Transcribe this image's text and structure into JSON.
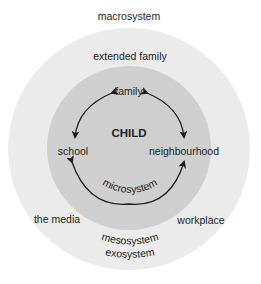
{
  "diagram": {
    "type": "nested-circles",
    "colors": {
      "background": "#ffffff",
      "outer_circle": "#ebebeb",
      "inner_circle": "#cfcfcf",
      "text": "#1e1e1e",
      "arrows": "#1e1e1e"
    },
    "labels": {
      "macrosystem": "macrosystem",
      "extended_family": "extended family",
      "family": "family",
      "child": "CHILD",
      "school": "school",
      "neighbourhood": "neighbourhood",
      "microsystem": "microsystem",
      "the_media": "the media",
      "mesosystem": "mesosystem",
      "workplace": "workplace",
      "exosystem": "exosystem"
    },
    "relationships": [
      {
        "from": "family",
        "to": "school",
        "type": "bidirectional"
      },
      {
        "from": "family",
        "to": "neighbourhood",
        "type": "bidirectional"
      },
      {
        "from": "school",
        "to": "neighbourhood",
        "type": "bidirectional"
      }
    ]
  }
}
